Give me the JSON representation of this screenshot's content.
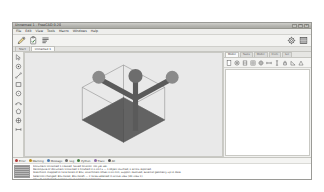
{
  "window": {
    "title": "Unnamed 1 - FreeCAD 0.20",
    "controls": [
      {
        "name": "minimize-button",
        "glyph": "–"
      },
      {
        "name": "maximize-button",
        "glyph": "□"
      },
      {
        "name": "close-button",
        "glyph": "✕"
      }
    ]
  },
  "menubar": {
    "items": [
      {
        "label": "File"
      },
      {
        "label": "Edit"
      },
      {
        "label": "View"
      },
      {
        "label": "Tools"
      },
      {
        "label": "Macro"
      },
      {
        "label": "Windows"
      },
      {
        "label": "Help"
      }
    ]
  },
  "toolbar": {
    "left_buttons": [
      {
        "name": "sketch-edit-button",
        "icon": "pencil-icon",
        "label": "Edit sketch"
      },
      {
        "name": "validate-sketch-button",
        "icon": "clipboard-check-icon",
        "label": "Validate sketch"
      },
      {
        "name": "merge-sketch-button",
        "icon": "list-lines-icon",
        "label": "Merge sketches"
      }
    ],
    "right_buttons": [
      {
        "name": "settings-button",
        "icon": "gear-icon",
        "label": "Preferences"
      },
      {
        "name": "workbench-button",
        "icon": "grid-panel-icon",
        "label": "Workbench"
      }
    ]
  },
  "document_tabs": {
    "tabs": [
      {
        "label": "Start",
        "active": false
      },
      {
        "label": "Unnamed 1",
        "active": true
      }
    ]
  },
  "left_rail": {
    "buttons": [
      {
        "name": "select-tool",
        "icon": "cursor-arrow-icon",
        "label": "Select"
      },
      {
        "name": "point-tool",
        "icon": "point-icon",
        "label": "Point"
      },
      {
        "name": "line-tool",
        "icon": "line-icon",
        "label": "Line"
      },
      {
        "name": "rectangle-tool",
        "icon": "rectangle-icon",
        "label": "Rectangle"
      },
      {
        "name": "circle-tool",
        "icon": "circle-icon",
        "label": "Circle"
      },
      {
        "name": "arc-tool",
        "icon": "arc-icon",
        "label": "Arc"
      },
      {
        "name": "polygon-tool",
        "icon": "polygon-icon",
        "label": "Polygon"
      },
      {
        "name": "constraint-tool",
        "icon": "constraint-icon",
        "label": "Constraint"
      },
      {
        "name": "dimension-tool",
        "icon": "dimension-icon",
        "label": "Dimension"
      }
    ]
  },
  "viewport": {
    "background_color": "#e9e9e9",
    "wire_color": "#8f8f8f",
    "face_fill_color": "#5e5e5e",
    "nav_axis_label": "navigation-axis-cross",
    "model": {
      "name": "Cube",
      "type": "box-wireframe",
      "selected_faces": 2
    }
  },
  "right_dock": {
    "tabs": [
      {
        "label": "Model",
        "active": true
      },
      {
        "label": "Tasks",
        "active": false
      },
      {
        "label": "Model",
        "active": false
      },
      {
        "label": "Elem",
        "active": false
      },
      {
        "label": "Sel",
        "active": false
      }
    ],
    "toolbar_buttons": [
      {
        "name": "new-sketch-button",
        "icon": "sheet-icon"
      },
      {
        "name": "view-section-button",
        "icon": "target-icon"
      },
      {
        "name": "clip-plane-button",
        "icon": "cut-icon"
      },
      {
        "name": "grid-toggle-button",
        "icon": "grid-icon"
      },
      {
        "name": "snap-button",
        "icon": "crosshair-icon"
      },
      {
        "name": "constraint-horizontal-button",
        "icon": "horizontal-icon"
      },
      {
        "name": "constraint-vertical-button",
        "icon": "vertical-icon"
      },
      {
        "name": "constraint-lock-button",
        "icon": "lock-icon"
      },
      {
        "name": "dimension-angle-button",
        "icon": "angle-icon"
      },
      {
        "name": "dimension-radius-button",
        "icon": "radius-icon"
      }
    ]
  },
  "console": {
    "filters": [
      {
        "label": "Error",
        "color": "#b03a3a"
      },
      {
        "label": "Warning",
        "color": "#b98d1e"
      },
      {
        "label": "Message",
        "color": "#4a7ab0"
      },
      {
        "label": "Log",
        "color": "#6f6f6f"
      },
      {
        "label": "Python",
        "color": "#3f7d3f"
      },
      {
        "label": "Trace",
        "color": "#8a6aa8"
      },
      {
        "label": "All",
        "color": "#555555"
      }
    ],
    "lines": [
      {
        "text": "Document Unnamed 1 created. Saved location: not yet set.",
        "level": "msg"
      },
      {
        "text": "Recompute of document Unnamed 1 finished in 0.012 s — 1 object touched, 0 errors reported.",
        "level": "msg"
      },
      {
        "text": "Sketch001 mapped to face Face6 of Box; attachment offset 0.00 mm, support resolved, external geometry up to date.",
        "level": "msg"
      },
      {
        "text": "Selection changed: Box.Face3, Box.Face5 — 2 faces selected in active view (3D view 1).",
        "level": "msg"
      },
      {
        "text": "View fit performed; camera set to isometric projection.",
        "level": "msg"
      }
    ]
  }
}
